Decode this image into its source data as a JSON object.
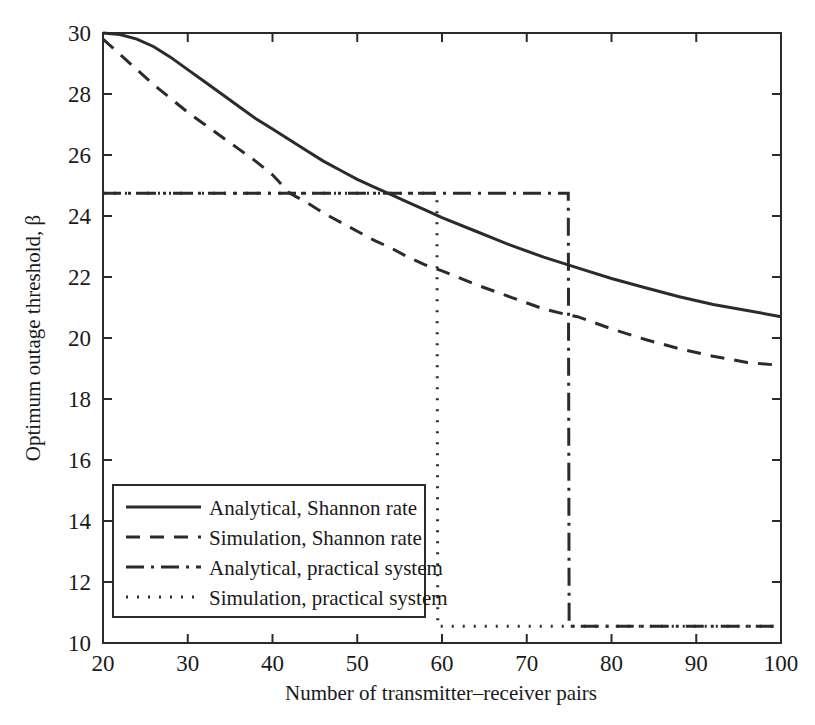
{
  "chart_data": {
    "type": "line",
    "title": "",
    "xlabel": "Number of transmitter–receiver pairs",
    "ylabel": "Optimum outage threshold, β",
    "xlim": [
      20,
      100
    ],
    "ylim": [
      10,
      30
    ],
    "xticks": [
      20,
      30,
      40,
      50,
      60,
      70,
      80,
      90,
      100
    ],
    "yticks": [
      10,
      12,
      14,
      16,
      18,
      20,
      22,
      24,
      26,
      28,
      30
    ],
    "xticklabels": [
      "20",
      "30",
      "40",
      "50",
      "60",
      "70",
      "80",
      "90",
      "100"
    ],
    "yticklabels": [
      "10",
      "12",
      "14",
      "16",
      "18",
      "20",
      "22",
      "24",
      "26",
      "28",
      "30"
    ],
    "grid": false,
    "legend_position": "lower left",
    "line_color": "#2b2b2b",
    "series": [
      {
        "name": "Analytical, Shannon rate",
        "style": "solid",
        "dasharray": "",
        "width": 3,
        "x": [
          20,
          22,
          24,
          26,
          28,
          30,
          32,
          34,
          36,
          38,
          40,
          42,
          44,
          46,
          48,
          50,
          52,
          54,
          56,
          58,
          60,
          64,
          68,
          72,
          76,
          80,
          84,
          88,
          92,
          96,
          100
        ],
        "y": [
          30.0,
          29.95,
          29.8,
          29.55,
          29.2,
          28.8,
          28.4,
          28.0,
          27.6,
          27.2,
          26.85,
          26.5,
          26.15,
          25.8,
          25.5,
          25.2,
          24.95,
          24.7,
          24.45,
          24.2,
          23.95,
          23.5,
          23.05,
          22.65,
          22.3,
          21.95,
          21.65,
          21.35,
          21.1,
          20.9,
          20.7
        ]
      },
      {
        "name": "Simulation, Shannon rate",
        "style": "dashed",
        "dasharray": "14,10",
        "width": 3,
        "x": [
          20,
          22,
          24,
          26,
          28,
          30,
          32,
          34,
          36,
          38,
          40,
          42,
          44,
          46,
          48,
          50,
          52,
          54,
          56,
          58,
          60,
          64,
          68,
          72,
          75,
          76,
          80,
          84,
          88,
          92,
          96,
          100
        ],
        "y": [
          29.8,
          29.3,
          28.8,
          28.3,
          27.85,
          27.4,
          27.0,
          26.6,
          26.2,
          25.8,
          25.35,
          24.75,
          24.45,
          24.1,
          23.8,
          23.5,
          23.2,
          22.95,
          22.65,
          22.4,
          22.2,
          21.75,
          21.35,
          20.95,
          20.75,
          20.7,
          20.3,
          19.95,
          19.65,
          19.4,
          19.2,
          19.1
        ]
      },
      {
        "name": "Analytical, practical system",
        "style": "dashdot",
        "dasharray": "18,7,3,7",
        "width": 3,
        "x": [
          20,
          74.9,
          75.0,
          100
        ],
        "y": [
          24.75,
          24.75,
          10.55,
          10.55
        ]
      },
      {
        "name": "Simulation, practical system",
        "style": "dotted",
        "dasharray": "2,9",
        "width": 3,
        "x": [
          20,
          59.4,
          59.5,
          100
        ],
        "y": [
          24.75,
          24.75,
          10.55,
          10.55
        ]
      }
    ]
  },
  "legend": {
    "items": [
      {
        "label": "Analytical, Shannon rate",
        "style": "solid"
      },
      {
        "label": "Simulation, Shannon rate",
        "style": "dashed"
      },
      {
        "label": "Analytical, practical system",
        "style": "dashdot"
      },
      {
        "label": "Simulation, practical system",
        "style": "dotted"
      }
    ]
  }
}
